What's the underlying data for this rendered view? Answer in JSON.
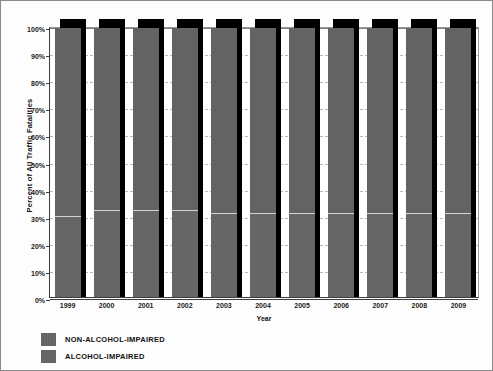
{
  "chart_data": {
    "type": "bar",
    "subtype": "stacked-100-percent",
    "title": "",
    "xlabel": "Year",
    "ylabel": "Percent of All Traffic Fatalities",
    "categories": [
      "1999",
      "2000",
      "2001",
      "2002",
      "2003",
      "2004",
      "2005",
      "2006",
      "2007",
      "2008",
      "2009"
    ],
    "ylim": [
      0,
      100
    ],
    "ytick_labels": [
      "0%",
      "10%",
      "20%",
      "30%",
      "40%",
      "50%",
      "60%",
      "70%",
      "80%",
      "90%",
      "100%"
    ],
    "ytick_values": [
      0,
      10,
      20,
      30,
      40,
      50,
      60,
      70,
      80,
      90,
      100
    ],
    "grid": true,
    "legend_position": "below-left",
    "series": [
      {
        "name": "NON-ALCOHOL-IMPAIRED",
        "color": "#636363",
        "values": [
          70,
          68,
          68,
          68,
          69,
          69,
          69,
          69,
          69,
          69,
          69
        ]
      },
      {
        "name": "ALCOHOL-IMPAIRED",
        "color": "#666666",
        "values": [
          30,
          32,
          32,
          32,
          31,
          31,
          31,
          31,
          31,
          31,
          31
        ]
      }
    ]
  },
  "axis": {
    "x_title": "Year",
    "y_title": "Percent of All Traffic Fatalities"
  },
  "legend": {
    "items": [
      {
        "label": "NON-ALCOHOL-IMPAIRED"
      },
      {
        "label": "ALCOHOL-IMPAIRED"
      }
    ]
  }
}
